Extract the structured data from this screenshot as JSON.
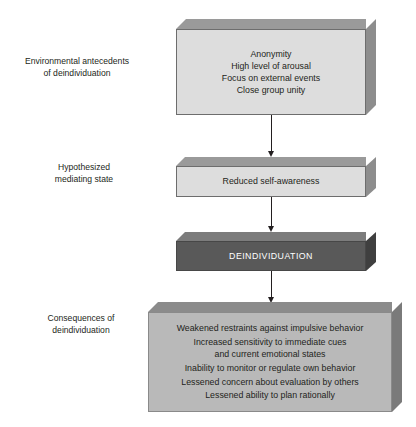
{
  "diagram": {
    "colors": {
      "light_box_fill": "#dddddd",
      "consequences_box_fill": "#b9b9b9",
      "dark_box_fill": "#595959",
      "text": "#231f20",
      "dark_box_text": "#ffffff",
      "arrow": "#231f20"
    },
    "labels": {
      "antecedents": "Environmental antecedents\nof deindividuation",
      "mediating": "Hypothesized\nmediating state",
      "consequences": "Consequences of\ndeindividuation"
    },
    "boxes": {
      "antecedents": {
        "lines": [
          "Anonymity",
          "High level of arousal",
          "Focus on external events",
          "Close group unity"
        ]
      },
      "mediating": {
        "lines": [
          "Reduced self-awareness"
        ]
      },
      "deindividuation": {
        "lines": [
          "DEINDIVIDUATION"
        ]
      },
      "consequences": {
        "lines": [
          "Weakened restraints against impulsive behavior",
          "Increased sensitivity to immediate cues\nand current emotional states",
          "Inability to monitor or regulate own behavior",
          "Lessened concern about evaluation by others",
          "Lessened ability to plan rationally"
        ]
      }
    },
    "arrows": [
      {
        "name": "antecedents-to-mediating",
        "direction": "down"
      },
      {
        "name": "mediating-to-deindividuation",
        "direction": "down"
      },
      {
        "name": "deindividuation-to-consequences",
        "direction": "down"
      }
    ]
  }
}
